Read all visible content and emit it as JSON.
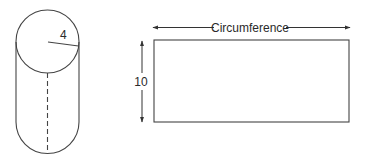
{
  "cylinder": {
    "radius_label": "4"
  },
  "net_rectangle": {
    "width_label": "Circumference",
    "height_label": "10"
  },
  "colors": {
    "stroke": "#333333",
    "background": "#ffffff"
  }
}
